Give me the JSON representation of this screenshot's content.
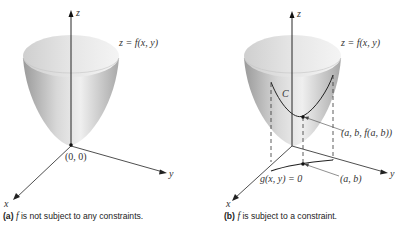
{
  "panels": [
    {
      "id": "a",
      "axis_z": "z",
      "axis_x": "x",
      "axis_y": "y",
      "surface_label": "z = f(x, y)",
      "origin_label": "(0, 0)",
      "caption_tag": "(a)",
      "caption_f": "f",
      "caption_text": " is not subject to any constraints."
    },
    {
      "id": "b",
      "axis_z": "z",
      "axis_x": "x",
      "axis_y": "y",
      "surface_label": "z = f(x, y)",
      "curve_label": "C",
      "point3d_label": "(a, b, f(a, b))",
      "point2d_label": "(a, b)",
      "constraint_label": "g(x, y) = 0",
      "caption_tag": "(b)",
      "caption_f": "f",
      "caption_text": " is subject to a constraint."
    }
  ]
}
